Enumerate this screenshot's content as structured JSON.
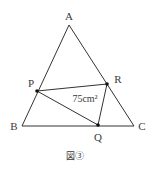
{
  "figure": {
    "caption": "図③",
    "stroke_color": "#333333",
    "points": {
      "A": {
        "label": "A",
        "x": 69,
        "y": 25
      },
      "B": {
        "label": "B",
        "x": 22,
        "y": 126
      },
      "C": {
        "label": "C",
        "x": 134,
        "y": 126
      },
      "P": {
        "label": "P",
        "x": 37,
        "y": 91
      },
      "Q": {
        "label": "Q",
        "x": 98,
        "y": 125
      },
      "R": {
        "label": "R",
        "x": 107,
        "y": 84
      }
    },
    "area_label": "75cm²",
    "area_value": "75",
    "area_unit": "cm²"
  }
}
